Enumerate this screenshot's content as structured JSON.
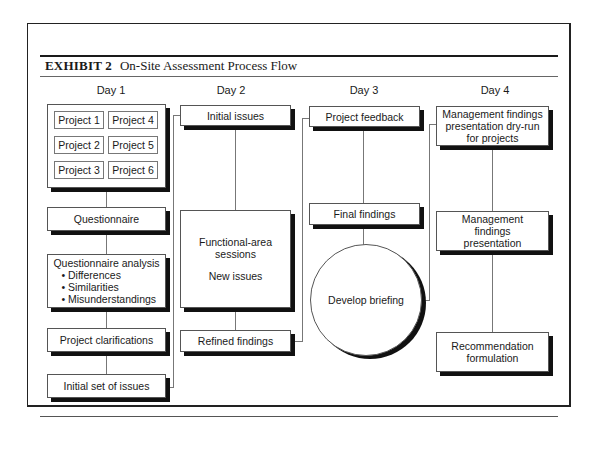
{
  "exhibit": {
    "label": "EXHIBIT 2",
    "title": "On-Site Assessment Process Flow"
  },
  "days": [
    {
      "label": "Day 1",
      "projects": [
        "Project 1",
        "Project 4",
        "Project 2",
        "Project 5",
        "Project 3",
        "Project 6"
      ],
      "steps": [
        "Questionnaire",
        "Questionnaire analysis",
        "Project clarifications",
        "Initial set of issues"
      ],
      "analysis_bullets": [
        "• Differences",
        "• Similarities",
        "• Misunderstandings"
      ]
    },
    {
      "label": "Day 2",
      "steps": [
        "Initial issues",
        "Functional-area sessions",
        "New issues",
        "Refined findings"
      ]
    },
    {
      "label": "Day 3",
      "steps": [
        "Project feedback",
        "Final findings",
        "Develop briefing"
      ]
    },
    {
      "label": "Day 4",
      "steps": [
        "Management findings presentation dry-run for projects",
        "Management findings presentation",
        "Recommendation formulation"
      ]
    }
  ]
}
